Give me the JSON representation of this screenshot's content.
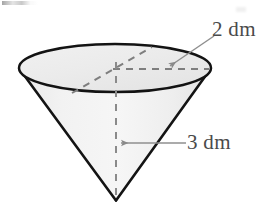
{
  "figure": {
    "shape": "cone",
    "orientation": "apex-down",
    "fill_color": "#f1f1f1",
    "top_face_color": "#ececec",
    "outline_color": "#1a1a1a",
    "dashed_color": "#7c7c7c",
    "leader_color": "#8a8a8a",
    "label_color": "#4a4a4a",
    "background_color": "#ffffff",
    "labels": {
      "radius": "2 dm",
      "height": "3 dm"
    },
    "measurements": [
      {
        "name": "radius",
        "value": 2,
        "unit": "dm",
        "text": "2 dm",
        "points_to": "top-face-radius"
      },
      {
        "name": "height",
        "value": 3,
        "unit": "dm",
        "text": "3 dm",
        "points_to": "central-axis"
      }
    ],
    "geometry": {
      "ellipse_center_x": 115,
      "ellipse_center_y": 68,
      "ellipse_rx": 96,
      "ellipse_ry": 24,
      "apex_x": 116,
      "apex_y": 200
    }
  }
}
